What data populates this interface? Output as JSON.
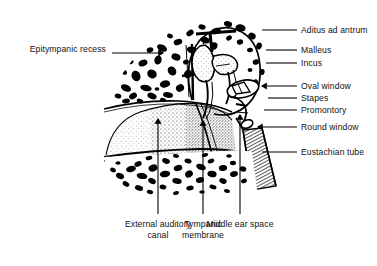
{
  "figure": {
    "background_color": "#ffffff",
    "ink_color": "#000000"
  },
  "labels_left": [
    {
      "id": "epitympanic-recess",
      "text": "Epitympanic recess",
      "x": 10,
      "y": 44,
      "leader_x1": 112,
      "leader_x2": 163,
      "leader_y": 53,
      "arrow": true
    }
  ],
  "labels_right": [
    {
      "id": "aditus-ad-antrum",
      "text": "Aditus ad antrum",
      "x": 301,
      "y": 25,
      "leader_x1": 262,
      "leader_x2": 297,
      "leader_y": 30,
      "arrow": false
    },
    {
      "id": "malleus",
      "text": "Malleus",
      "x": 301,
      "y": 45,
      "leader_x1": 266,
      "leader_x2": 297,
      "leader_y": 50,
      "arrow": false
    },
    {
      "id": "incus",
      "text": "Incus",
      "x": 301,
      "y": 58,
      "leader_x1": 266,
      "leader_x2": 297,
      "leader_y": 63,
      "arrow": false
    },
    {
      "id": "oval-window",
      "text": "Oval window",
      "x": 301,
      "y": 81,
      "leader_x1": 262,
      "leader_x2": 297,
      "leader_y": 86,
      "arrow": true
    },
    {
      "id": "stapes",
      "text": "Stapes",
      "x": 301,
      "y": 93,
      "leader_x1": 268,
      "leader_x2": 297,
      "leader_y": 98,
      "arrow": false
    },
    {
      "id": "promontory",
      "text": "Promontory",
      "x": 301,
      "y": 105,
      "leader_x1": 264,
      "leader_x2": 297,
      "leader_y": 110,
      "arrow": false
    },
    {
      "id": "round-window",
      "text": "Round window",
      "x": 301,
      "y": 122,
      "leader_x1": 258,
      "leader_x2": 297,
      "leader_y": 127,
      "arrow": true
    },
    {
      "id": "eustachian-tube",
      "text": "Eustachian tube",
      "x": 301,
      "y": 147,
      "leader_x1": 262,
      "leader_x2": 297,
      "leader_y": 152,
      "arrow": false
    }
  ],
  "labels_bottom": [
    {
      "id": "external-auditory-canal",
      "text": "External auditory canal",
      "center_x": 158,
      "text_y": 219,
      "pointer_x": 158,
      "pointer_y1": 119,
      "pointer_y2": 214,
      "arrow": true
    },
    {
      "id": "tympanic-membrane",
      "text": "Tympanic membrane",
      "center_x": 203,
      "text_y": 219,
      "pointer_x": 203,
      "pointer_y1": 121,
      "pointer_y2": 214,
      "arrow": true
    },
    {
      "id": "middle-ear-space",
      "text": "Middle ear space",
      "center_x": 240,
      "text_y": 219,
      "pointer_x": 240,
      "pointer_y1": 115,
      "pointer_y2": 214,
      "arrow": true
    }
  ],
  "anatomy_parts": [
    "mastoid-air-cells-upper",
    "mastoid-air-cells-lower",
    "tympanic-cavity-outline",
    "malleus-bone",
    "incus-bone",
    "stapes-bone",
    "oval-window-opening",
    "round-window-opening",
    "promontory-bulge",
    "eustachian-tube-hatching",
    "external-auditory-canal-wall",
    "tympanic-membrane-line"
  ]
}
